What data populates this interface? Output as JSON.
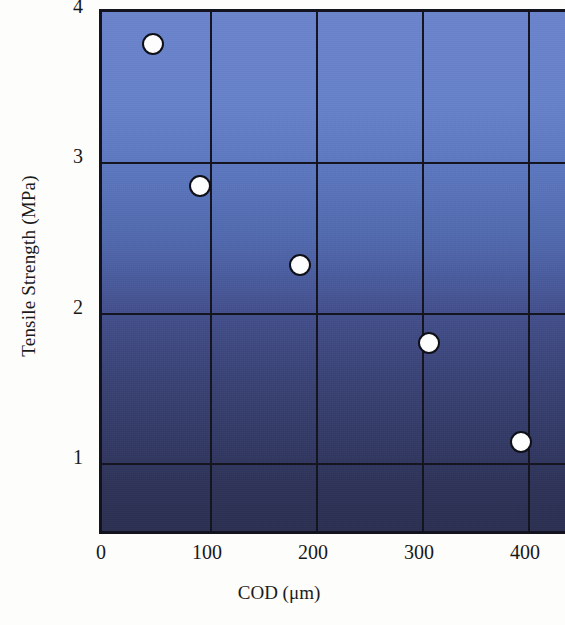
{
  "chart_data": {
    "type": "scatter",
    "title": "",
    "xlabel": "COD (μm)",
    "ylabel": "Tensile Strength (MPa)",
    "xlim": [
      0,
      440
    ],
    "ylim": [
      0.55,
      4.0
    ],
    "xticks": [
      0,
      100,
      200,
      300,
      400
    ],
    "xtick_labels": [
      "0",
      "100",
      "200",
      "300",
      "400"
    ],
    "yticks": [
      1,
      2,
      3,
      4
    ],
    "ytick_labels": [
      "1",
      "2",
      "3",
      "4"
    ],
    "grid": true,
    "legend": "none",
    "series": [
      {
        "name": "Tensile Strength vs COD",
        "marker": "circle",
        "marker_face_color": "#fdfdfd",
        "marker_edge_color": "#0f0f18",
        "points": [
          {
            "x": 46,
            "y": 3.79
          },
          {
            "x": 91,
            "y": 2.84
          },
          {
            "x": 185,
            "y": 2.32
          },
          {
            "x": 307,
            "y": 1.8
          },
          {
            "x": 393,
            "y": 1.14
          }
        ]
      }
    ],
    "plot_background": {
      "type": "vertical-gradient",
      "top_color": "#6a84cc",
      "bottom_color": "#2b2f51"
    },
    "axis_color": "#13131f",
    "grid_color": "#15151f"
  }
}
